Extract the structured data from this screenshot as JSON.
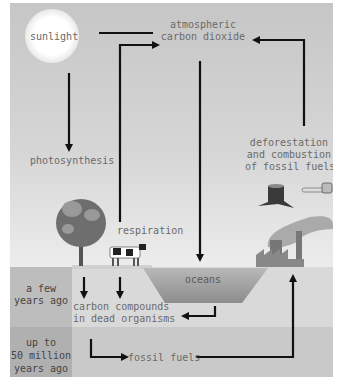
{
  "diagram": {
    "nodes": {
      "sunlight": "sunlight",
      "atmo_line1": "atmospheric",
      "atmo_line2": "carbon dioxide",
      "photosynthesis": "photosynthesis",
      "respiration": "respiration",
      "defor_line1": "deforestation",
      "defor_line2": "and combustion",
      "defor_line3": "of fossil fuels",
      "oceans": "oceans",
      "dead_line1": "carbon compounds",
      "dead_line2": "in dead organisms",
      "fossil": "fossil fuels"
    },
    "time_labels": {
      "recent_line1": "a few",
      "recent_line2": "years ago",
      "old_line1": "up to",
      "old_line2": "50 million",
      "old_line3": "years ago"
    },
    "icons": [
      "sun-icon",
      "tree-icon",
      "cow-icon",
      "stump-icon",
      "chainsaw-icon",
      "factory-icon",
      "smoke-icon"
    ],
    "colors": {
      "arrow": "#111111",
      "text": "#6a6a6a",
      "ground_upper": "#d9d9d9",
      "ground_lower": "#c9c9c9",
      "label_col_upper": "#bdbdbd",
      "label_col_lower": "#b0b0b0",
      "ocean": "#9a9a9a"
    }
  }
}
